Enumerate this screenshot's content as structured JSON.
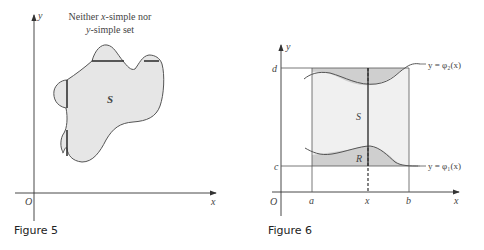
{
  "figures": [
    {
      "caption": "Figure 5",
      "title_line1": "Neither x-simple nor",
      "title_line2": "y-simple set",
      "title_parts": {
        "neither": "Neither ",
        "x": "x",
        "simple_nor": "-simple nor",
        "y": "y",
        "simple_set": "-simple set"
      },
      "region_label": "S",
      "axis_labels": {
        "x": "x",
        "y": "y",
        "origin": "O"
      }
    },
    {
      "caption": "Figure 6",
      "region_outer_label": "S",
      "region_inner_label": "R",
      "axis_labels": {
        "x": "x",
        "y": "y",
        "origin": "O"
      },
      "x_ticks": [
        "a",
        "x",
        "b"
      ],
      "y_ticks": [
        "d",
        "c"
      ],
      "curve_labels": {
        "upper": "y = φ₂(x)",
        "lower": "y = φ₁(x)"
      }
    }
  ],
  "colors": {
    "fill": "#e6e6e6",
    "fill_dark": "#cfcfcf",
    "stroke": "#555555",
    "axis": "#333333"
  }
}
